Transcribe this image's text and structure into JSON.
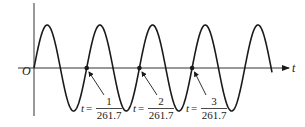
{
  "diagram": {
    "type": "sinusoid-time-plot",
    "axes": {
      "origin_label": "O",
      "horizontal_label": "t"
    },
    "wave": {
      "periods_shown": 4.5,
      "start": "origin",
      "stroke_color": "#1a1a1a"
    },
    "markers": [
      {
        "t_prefix": "t =",
        "numerator": "1",
        "denominator": "261.7"
      },
      {
        "t_prefix": "t =",
        "numerator": "2",
        "denominator": "261.7"
      },
      {
        "t_prefix": "t =",
        "numerator": "3",
        "denominator": "261.7"
      }
    ],
    "colors": {
      "ink": "#1a1a1a",
      "axis": "#333333",
      "background": "#ffffff"
    }
  }
}
